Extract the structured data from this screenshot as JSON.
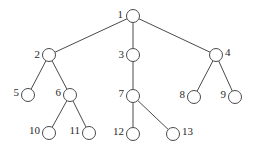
{
  "diagram": {
    "type": "tree",
    "node_radius": 6.5,
    "colors": {
      "stroke": "#4a4a4a",
      "text": "#2a2a2a",
      "background": "#ffffff"
    },
    "nodes": [
      {
        "id": "1",
        "label": "1",
        "x": 133,
        "y": 16,
        "lx": 123,
        "ly": 15,
        "anchor": "end"
      },
      {
        "id": "2",
        "label": "2",
        "x": 49,
        "y": 55,
        "lx": 40,
        "ly": 55,
        "anchor": "end"
      },
      {
        "id": "3",
        "label": "3",
        "x": 133,
        "y": 55,
        "lx": 124,
        "ly": 55,
        "anchor": "end"
      },
      {
        "id": "4",
        "label": "4",
        "x": 216,
        "y": 55,
        "lx": 225,
        "ly": 53,
        "anchor": "start"
      },
      {
        "id": "5",
        "label": "5",
        "x": 28,
        "y": 95,
        "lx": 19,
        "ly": 93,
        "anchor": "end"
      },
      {
        "id": "6",
        "label": "6",
        "x": 70,
        "y": 95,
        "lx": 61,
        "ly": 93,
        "anchor": "end"
      },
      {
        "id": "7",
        "label": "7",
        "x": 133,
        "y": 96,
        "lx": 124,
        "ly": 94,
        "anchor": "end"
      },
      {
        "id": "8",
        "label": "8",
        "x": 194,
        "y": 97,
        "lx": 185,
        "ly": 95,
        "anchor": "end"
      },
      {
        "id": "9",
        "label": "9",
        "x": 235,
        "y": 97,
        "lx": 226,
        "ly": 95,
        "anchor": "end"
      },
      {
        "id": "10",
        "label": "10",
        "x": 49,
        "y": 133,
        "lx": 40,
        "ly": 131,
        "anchor": "end"
      },
      {
        "id": "11",
        "label": "11",
        "x": 89,
        "y": 133,
        "lx": 80,
        "ly": 131,
        "anchor": "end"
      },
      {
        "id": "12",
        "label": "12",
        "x": 133,
        "y": 134,
        "lx": 124,
        "ly": 132,
        "anchor": "end"
      },
      {
        "id": "13",
        "label": "13",
        "x": 173,
        "y": 134,
        "lx": 182,
        "ly": 132,
        "anchor": "start"
      }
    ],
    "edges": [
      [
        "1",
        "2"
      ],
      [
        "1",
        "3"
      ],
      [
        "1",
        "4"
      ],
      [
        "2",
        "5"
      ],
      [
        "2",
        "6"
      ],
      [
        "3",
        "7"
      ],
      [
        "4",
        "8"
      ],
      [
        "4",
        "9"
      ],
      [
        "6",
        "10"
      ],
      [
        "6",
        "11"
      ],
      [
        "7",
        "12"
      ],
      [
        "7",
        "13"
      ]
    ]
  }
}
